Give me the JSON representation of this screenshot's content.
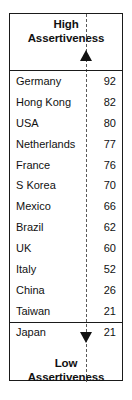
{
  "chart_data": {
    "type": "bar",
    "title": "Assertiveness",
    "xlabel": "",
    "ylabel": "Assertiveness score",
    "axis_top_label": "High Assertiveness",
    "axis_bottom_label": "Low Assertiveness",
    "categories": [
      "Germany",
      "Hong Kong",
      "USA",
      "Netherlands",
      "France",
      "S Korea",
      "Mexico",
      "Brazil",
      "UK",
      "Italy",
      "China",
      "Taiwan",
      "Japan"
    ],
    "values": [
      92,
      82,
      80,
      77,
      76,
      70,
      66,
      62,
      60,
      52,
      26,
      21,
      21
    ],
    "ylim": [
      0,
      100
    ],
    "grid": false,
    "legend": null,
    "orientation": "vertical-ranked-list",
    "annotations": [
      "High Assertiveness",
      "Low Assertiveness"
    ]
  },
  "figure": {
    "top_cap": {
      "line1": "High",
      "line2": "Assertiveness",
      "arrow": "arrow-up"
    },
    "bottom_cap": {
      "line1": "Low",
      "line2": "Assertiveness",
      "arrow": "arrow-down"
    },
    "rows": [
      {
        "name": "Germany",
        "value": "92"
      },
      {
        "name": "Hong Kong",
        "value": "82"
      },
      {
        "name": "USA",
        "value": "80"
      },
      {
        "name": "Netherlands",
        "value": "77"
      },
      {
        "name": "France",
        "value": "76"
      },
      {
        "name": "S Korea",
        "value": "70"
      },
      {
        "name": "Mexico",
        "value": "66"
      },
      {
        "name": "Brazil",
        "value": "62"
      },
      {
        "name": "UK",
        "value": "60"
      },
      {
        "name": "Italy",
        "value": "52"
      },
      {
        "name": "China",
        "value": "26"
      },
      {
        "name": "Taiwan",
        "value": "21"
      },
      {
        "name": "Japan",
        "value": "21"
      }
    ]
  },
  "colors": {
    "border": "#1a1a1a",
    "text": "#111111",
    "axis": "#5a5a5a",
    "background": "#ffffff"
  }
}
